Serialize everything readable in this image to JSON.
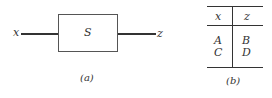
{
  "diagram_a": {
    "input_label": "x",
    "block_label": "S",
    "output_label": "z",
    "caption": "(a)"
  },
  "table_b": {
    "headers": [
      "x",
      "z"
    ],
    "rows": [
      [
        "A",
        "B"
      ],
      [
        "C",
        "D"
      ]
    ],
    "caption": "(b)"
  }
}
